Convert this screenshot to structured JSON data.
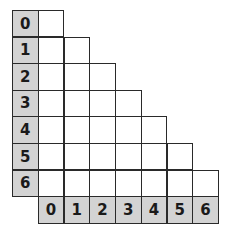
{
  "diagram": {
    "type": "lower-triangular-grid",
    "row_labels": [
      "0",
      "1",
      "2",
      "3",
      "4",
      "5",
      "6"
    ],
    "col_labels": [
      "0",
      "1",
      "2",
      "3",
      "4",
      "5",
      "6"
    ],
    "colors": {
      "header_fill": "#d3d3d3",
      "cell_fill": "#ffffff",
      "border": "#2a2a2a"
    }
  }
}
